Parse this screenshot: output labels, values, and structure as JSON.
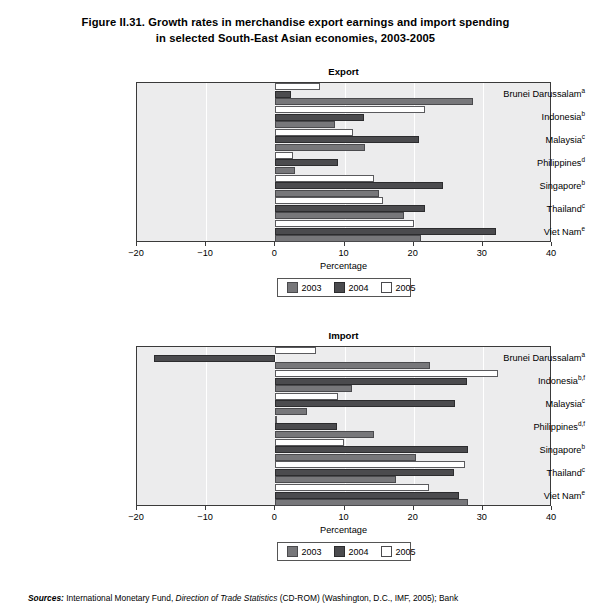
{
  "figure": {
    "title_line1": "Figure II.31.   Growth rates in merchandise export earnings and import spending",
    "title_line2": "in selected South-East Asian economies, 2003-2005"
  },
  "legend": {
    "items": [
      {
        "label": "2003",
        "color": "#77777a"
      },
      {
        "label": "2004",
        "color": "#4b4b4e"
      },
      {
        "label": "2005",
        "color": "#ffffff"
      }
    ]
  },
  "sources": {
    "prefix": "Sources:",
    "text": " International Monetary Fund, ",
    "italic1": "Direction of Trade Statistics",
    "text2": " (CD-ROM) (Washington, D.C., IMF, 2005); Bank"
  },
  "chart_data": [
    {
      "type": "bar",
      "title": "Export",
      "orientation": "horizontal",
      "xlabel": "Percentage",
      "ylabel": "",
      "xlim": [
        -20,
        40
      ],
      "xticks": [
        -20,
        -10,
        0,
        10,
        20,
        30,
        40
      ],
      "xticklabels": [
        "−20",
        "−10",
        "0",
        "10",
        "20",
        "30",
        "40"
      ],
      "grid": "vertical-white",
      "legend_position": "below",
      "categories": [
        "Brunei Darussalam",
        "Indonesia",
        "Malaysia",
        "Philippines",
        "Singapore",
        "Thailand",
        "Viet Nam"
      ],
      "category_footnotes": [
        "a",
        "b",
        "c",
        "d",
        "b",
        "c",
        "e"
      ],
      "series": [
        {
          "name": "2003",
          "values": [
            28.6,
            8.6,
            12.9,
            2.9,
            15.0,
            18.6,
            21.1
          ]
        },
        {
          "name": "2004",
          "values": [
            2.3,
            12.8,
            20.7,
            9.1,
            24.3,
            21.7,
            31.9
          ]
        },
        {
          "name": "2005",
          "values": [
            6.4,
            21.7,
            11.3,
            2.6,
            14.3,
            15.5,
            20.0
          ]
        }
      ]
    },
    {
      "type": "bar",
      "title": "Import",
      "orientation": "horizontal",
      "xlabel": "Percentage",
      "ylabel": "",
      "xlim": [
        -20,
        40
      ],
      "xticks": [
        -20,
        -10,
        0,
        10,
        20,
        30,
        40
      ],
      "xticklabels": [
        "−20",
        "−10",
        "0",
        "10",
        "20",
        "30",
        "40"
      ],
      "grid": "vertical-white",
      "legend_position": "below",
      "categories": [
        "Brunei Darussalam",
        "Indonesia",
        "Malaysia",
        "Philippines",
        "Singapore",
        "Thailand",
        "Viet Nam"
      ],
      "category_footnotes": [
        "a",
        "b,f",
        "c",
        "d,f",
        "b",
        "c",
        "e"
      ],
      "series": [
        {
          "name": "2003",
          "values": [
            22.3,
            11.1,
            4.6,
            14.3,
            20.3,
            17.4,
            27.9
          ]
        },
        {
          "name": "2004",
          "values": [
            -17.5,
            27.7,
            26.0,
            8.9,
            27.8,
            25.8,
            26.6
          ]
        },
        {
          "name": "2005",
          "values": [
            5.9,
            32.2,
            9.0,
            0.3,
            9.9,
            27.4,
            22.2
          ]
        }
      ]
    }
  ]
}
